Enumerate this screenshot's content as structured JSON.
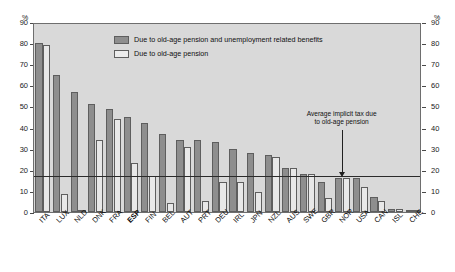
{
  "axis": {
    "unit_left": "%",
    "unit_right": "%",
    "ticks": [
      90,
      80,
      70,
      60,
      50,
      40,
      30,
      20,
      10,
      0
    ]
  },
  "legend": {
    "items": [
      {
        "label": "Due to old-age pension and unemployment related benefits",
        "color": "#8e8e8e",
        "key": "combined"
      },
      {
        "label": "Due to old-age pension",
        "color": "#ececec",
        "key": "pension"
      }
    ]
  },
  "annotation": {
    "text": "Average implicit tax due\nto old-age pension",
    "value": 16.5
  },
  "chart_data": {
    "type": "bar",
    "title": "",
    "xlabel": "",
    "ylabel": "%",
    "ylim": [
      0,
      90
    ],
    "grid": false,
    "legend_position": "top-center",
    "categories": [
      "ITA",
      "LUX",
      "NLD",
      "DNK",
      "FRA",
      "ESP",
      "FIN",
      "BEL",
      "AUT",
      "PRT",
      "DEU",
      "IRL",
      "JPN",
      "NZL",
      "AUS",
      "SWE",
      "GBR",
      "NOR",
      "USA",
      "CAN",
      "ISL",
      "CHE"
    ],
    "highlight_category": "ESP",
    "series": [
      {
        "name": "Due to old-age pension and unemployment related benefits",
        "values": [
          80,
          65,
          57,
          51,
          49,
          45,
          42,
          37,
          34,
          34,
          33,
          30,
          28,
          27,
          21,
          18,
          14,
          16,
          16,
          7,
          1.5,
          1
        ]
      },
      {
        "name": "Due to old-age pension",
        "values": [
          79,
          8.5,
          0.5,
          34,
          44,
          23,
          17,
          4.5,
          31,
          5,
          14,
          14,
          9.5,
          26,
          21,
          18,
          6.5,
          16,
          12,
          5,
          1.5,
          1
        ]
      }
    ],
    "average_line": 16.5
  }
}
